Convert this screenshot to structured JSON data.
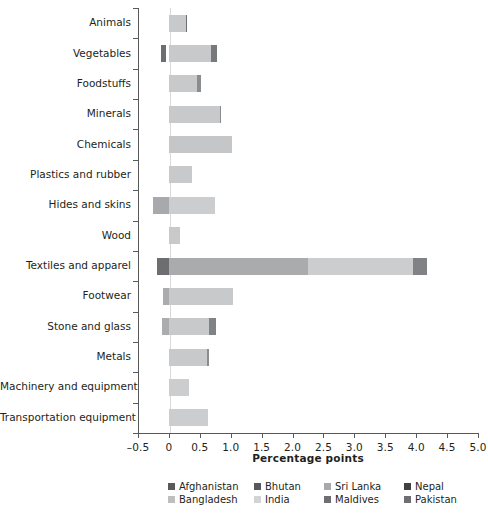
{
  "chart_data": {
    "type": "bar",
    "orientation": "horizontal",
    "stacked": true,
    "title": "",
    "xlabel": "Percentage points",
    "ylabel": "",
    "xlim": [
      -0.5,
      5.0
    ],
    "xticks": [
      -0.5,
      0,
      0.5,
      1.0,
      1.5,
      2.0,
      2.5,
      3.0,
      3.5,
      4.0,
      4.5,
      5.0
    ],
    "xticklabels": [
      "–0.5",
      "0",
      "0.5",
      "1.0",
      "1.5",
      "2.0",
      "2.5",
      "3.0",
      "3.5",
      "4.0",
      "4.5",
      "5.0"
    ],
    "grid": false,
    "legend_position": "bottom",
    "categories": [
      "Animals",
      "Vegetables",
      "Foodstuffs",
      "Minerals",
      "Chemicals",
      "Plastics and rubber",
      "Hides and skins",
      "Wood",
      "Textiles and apparel",
      "Footwear",
      "Stone and glass",
      "Metals",
      "Machinery and equipment",
      "Transportation equipment"
    ],
    "series": [
      {
        "name": "Afghanistan",
        "color": "#58595b",
        "values": [
          0.0,
          -0.04,
          0.0,
          0.0,
          0.0,
          0.0,
          0.0,
          0.0,
          -0.03,
          -0.03,
          0.0,
          0.0,
          0.0,
          0.0
        ]
      },
      {
        "name": "Bangladesh",
        "color": "#bcbec0",
        "values": [
          0.27,
          0.71,
          0.49,
          0.84,
          1.02,
          0.37,
          0.0,
          0.0,
          2.25,
          1.0,
          0.68,
          0.62,
          0.32,
          0.63
        ]
      },
      {
        "name": "Bhutan",
        "color": "#6d6e71",
        "values": [
          0.0,
          0.0,
          0.0,
          0.0,
          0.0,
          0.0,
          0.0,
          0.0,
          0.0,
          0.0,
          0.0,
          0.0,
          0.0,
          0.0
        ]
      },
      {
        "name": "India",
        "color": "#d1d3d4",
        "values": [
          0.0,
          0.0,
          0.0,
          0.0,
          0.0,
          0.0,
          0.74,
          0.18,
          1.72,
          0.0,
          0.0,
          0.0,
          0.0,
          0.0
        ]
      },
      {
        "name": "Sri Lanka",
        "color": "#a7a9ac",
        "values": [
          0.0,
          0.0,
          0.0,
          0.0,
          0.0,
          0.0,
          -0.24,
          0.0,
          0.0,
          -0.08,
          -0.1,
          0.0,
          0.0,
          0.0
        ]
      },
      {
        "name": "Maldives",
        "color": "#808285",
        "values": [
          0.0,
          0.0,
          0.0,
          0.0,
          0.0,
          0.0,
          0.0,
          0.0,
          0.0,
          0.0,
          0.0,
          0.0,
          0.0,
          0.0
        ]
      },
      {
        "name": "Nepal",
        "color": "#414042",
        "values": [
          0.03,
          0.0,
          0.0,
          0.0,
          0.0,
          0.0,
          0.0,
          0.0,
          0.0,
          0.0,
          0.0,
          0.0,
          0.0,
          0.0
        ]
      },
      {
        "name": "Pakistan",
        "color": "#6d6e71",
        "values": [
          0.0,
          0.1,
          0.06,
          0.02,
          0.0,
          0.0,
          0.0,
          0.0,
          0.22,
          0.02,
          0.12,
          0.04,
          0.0,
          0.0
        ]
      }
    ],
    "bars": [
      {
        "category": "Animals",
        "segments": [
          {
            "series": "Bangladesh",
            "from": 0.0,
            "to": 0.27,
            "color": "#c7c9cb"
          },
          {
            "series": "Nepal",
            "from": 0.27,
            "to": 0.3,
            "color": "#6d6e71"
          }
        ]
      },
      {
        "category": "Vegetables",
        "segments": [
          {
            "series": "Afghanistan",
            "from": -0.12,
            "to": -0.05,
            "color": "#6d6e71"
          },
          {
            "series": "Bangladesh",
            "from": 0.0,
            "to": 0.68,
            "color": "#c7c9cb"
          },
          {
            "series": "Pakistan",
            "from": 0.68,
            "to": 0.78,
            "color": "#77797c"
          }
        ]
      },
      {
        "category": "Foodstuffs",
        "segments": [
          {
            "series": "Bangladesh",
            "from": 0.0,
            "to": 0.46,
            "color": "#c7c9cb"
          },
          {
            "series": "Pakistan",
            "from": 0.46,
            "to": 0.52,
            "color": "#8a8c8f"
          }
        ]
      },
      {
        "category": "Minerals",
        "segments": [
          {
            "series": "Bangladesh",
            "from": 0.0,
            "to": 0.82,
            "color": "#c7c9cb"
          },
          {
            "series": "Pakistan",
            "from": 0.82,
            "to": 0.85,
            "color": "#8a8c8f"
          }
        ]
      },
      {
        "category": "Chemicals",
        "segments": [
          {
            "series": "Bangladesh",
            "from": 0.0,
            "to": 1.02,
            "color": "#c4c6c8"
          }
        ]
      },
      {
        "category": "Plastics and rubber",
        "segments": [
          {
            "series": "Bangladesh",
            "from": 0.0,
            "to": 0.37,
            "color": "#c7c9cb"
          }
        ]
      },
      {
        "category": "Hides and skins",
        "segments": [
          {
            "series": "Sri Lanka",
            "from": -0.25,
            "to": 0.0,
            "color": "#a7a9ac"
          },
          {
            "series": "India",
            "from": 0.0,
            "to": 0.74,
            "color": "#cbcdcf"
          }
        ]
      },
      {
        "category": "Wood",
        "segments": [
          {
            "series": "India",
            "from": 0.0,
            "to": 0.18,
            "color": "#c7c9cb"
          }
        ]
      },
      {
        "category": "Textiles and apparel",
        "segments": [
          {
            "series": "Afghanistan",
            "from": -0.2,
            "to": 0.0,
            "color": "#6d6e71"
          },
          {
            "series": "Bangladesh",
            "from": 0.0,
            "to": 2.25,
            "color": "#a9abad"
          },
          {
            "series": "India",
            "from": 2.25,
            "to": 3.95,
            "color": "#cbcdcf"
          },
          {
            "series": "Pakistan",
            "from": 3.95,
            "to": 4.18,
            "color": "#808285"
          }
        ]
      },
      {
        "category": "Footwear",
        "segments": [
          {
            "series": "Sri Lanka",
            "from": -0.09,
            "to": 0.0,
            "color": "#aaacae"
          },
          {
            "series": "Bangladesh",
            "from": 0.0,
            "to": 1.03,
            "color": "#c7c9cb"
          }
        ]
      },
      {
        "category": "Stone and glass",
        "segments": [
          {
            "series": "Sri Lanka",
            "from": -0.11,
            "to": 0.0,
            "color": "#aaacae"
          },
          {
            "series": "Bangladesh",
            "from": 0.0,
            "to": 0.65,
            "color": "#c7c9cb"
          },
          {
            "series": "Pakistan",
            "from": 0.65,
            "to": 0.77,
            "color": "#808285"
          }
        ]
      },
      {
        "category": "Metals",
        "segments": [
          {
            "series": "Bangladesh",
            "from": 0.0,
            "to": 0.61,
            "color": "#c7c9cb"
          },
          {
            "series": "Pakistan",
            "from": 0.61,
            "to": 0.65,
            "color": "#8a8c8f"
          }
        ]
      },
      {
        "category": "Machinery and equipment",
        "segments": [
          {
            "series": "Bangladesh",
            "from": 0.0,
            "to": 0.32,
            "color": "#cbcdcf"
          }
        ]
      },
      {
        "category": "Transportation equipment",
        "segments": [
          {
            "series": "Bangladesh",
            "from": 0.0,
            "to": 0.63,
            "color": "#cbcdcf"
          }
        ]
      }
    ]
  },
  "legend": {
    "rows": [
      [
        {
          "label": "Afghanistan",
          "color": "#58595b"
        },
        {
          "label": "Bhutan",
          "color": "#58595b"
        },
        {
          "label": "Sri Lanka",
          "color": "#a7a9ac"
        },
        {
          "label": "Nepal",
          "color": "#414042"
        }
      ],
      [
        {
          "label": "Bangladesh",
          "color": "#bcbec0"
        },
        {
          "label": "India",
          "color": "#d1d3d4"
        },
        {
          "label": "Maldives",
          "color": "#6d6e71"
        },
        {
          "label": "Pakistan",
          "color": "#6d6e71"
        }
      ]
    ]
  }
}
